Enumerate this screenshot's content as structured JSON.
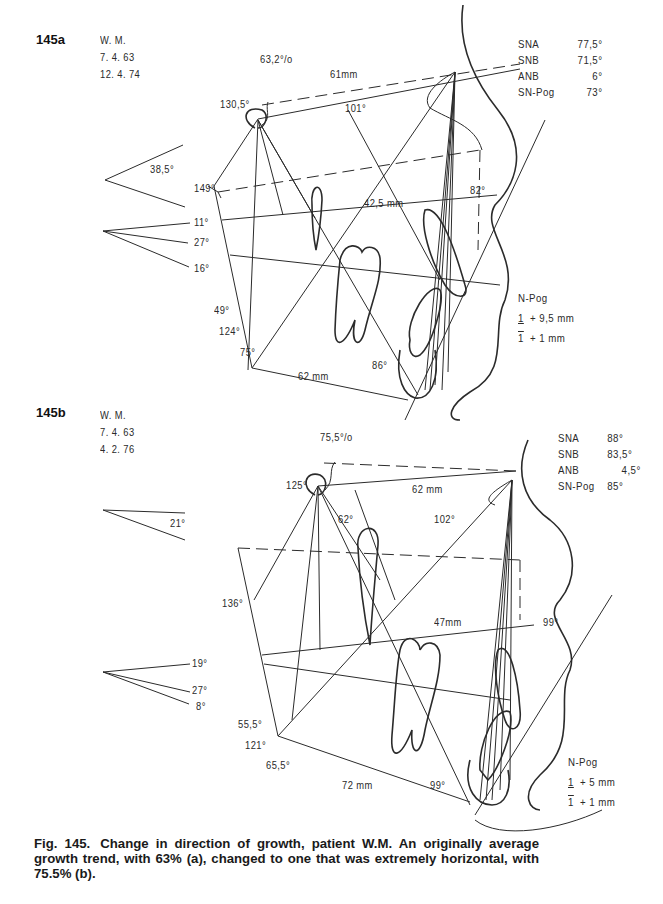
{
  "figure": {
    "number": "Fig. 145.",
    "caption": "Change in direction of growth, patient W.M. An originally average growth trend, with 63% (a), changed to one that was extremely horizontal, with 75.5% (b)."
  },
  "panel_a": {
    "label": "145a",
    "patient": [
      "W. M.",
      "7. 4. 63",
      "12. 4. 74"
    ],
    "ratio": "63,2°/o",
    "measurements": [
      {
        "key": "SNA",
        "value": "77,5°"
      },
      {
        "key": "SNB",
        "value": "71,5°"
      },
      {
        "key": "ANB",
        "value": "6°"
      },
      {
        "key": "SN-Pog",
        "value": "73°"
      }
    ],
    "angles": {
      "saddle": "130,5°",
      "anterior_cranial_length": "61mm",
      "angle_101": "101°",
      "cranial_base_inclination": "38,5°",
      "angle_149": "149°",
      "palatal_length": "42,5 mm",
      "angle_82": "82°",
      "angle_11": "11°",
      "angle_27": "27°",
      "angle_16": "16°",
      "gonial_upper": "49°",
      "gonial": "124°",
      "gonial_lower": "75°",
      "mandibular_length": "62 mm",
      "angle_86": "86°"
    },
    "npog": {
      "title": "N-Pog",
      "upper_incisor": "+ 9,5 mm",
      "lower_incisor": "+ 1 mm",
      "tooth_symbol": "1"
    }
  },
  "panel_b": {
    "label": "145b",
    "patient": [
      "W. M.",
      "7. 4. 63",
      "4. 2. 76"
    ],
    "ratio": "75,5°/o",
    "measurements": [
      {
        "key": "SNA",
        "value": "88°"
      },
      {
        "key": "SNB",
        "value": "83,5°"
      },
      {
        "key": "ANB",
        "value": "4,5°"
      },
      {
        "key": "SN-Pog",
        "value": "85°"
      }
    ],
    "angles": {
      "saddle": "125°",
      "anterior_cranial_length": "62 mm",
      "angle_62": "62°",
      "angle_102": "102°",
      "cranial_base_inclination": "21°",
      "angle_136": "136°",
      "palatal_length": "47mm",
      "angle_99_upper": "99°",
      "angle_19": "19°",
      "angle_27": "27°",
      "angle_8": "8°",
      "gonial_upper": "55,5°",
      "gonial": "121°",
      "gonial_lower": "65,5°",
      "mandibular_length": "72 mm",
      "angle_99_lower": "99°"
    },
    "npog": {
      "title": "N-Pog",
      "upper_incisor": "+ 5 mm",
      "lower_incisor": "+ 1 mm",
      "tooth_symbol": "1"
    }
  }
}
